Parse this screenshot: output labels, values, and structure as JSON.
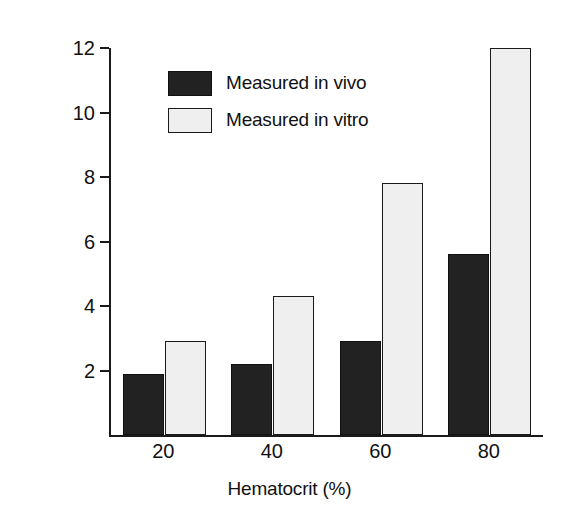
{
  "chart_data": {
    "type": "bar",
    "title": "",
    "xlabel": "Hematocrit (%)",
    "ylabel": "Viscosity (relative to water)",
    "categories": [
      "20",
      "40",
      "60",
      "80"
    ],
    "series": [
      {
        "name": "Measured in vivo",
        "values": [
          1.9,
          2.2,
          2.9,
          5.6
        ],
        "color": "#222222"
      },
      {
        "name": "Measured in vitro",
        "values": [
          2.9,
          4.3,
          7.8,
          12.0
        ],
        "color": "#efefef"
      }
    ],
    "ylim": [
      0,
      12
    ],
    "yticks": [
      "2",
      "4",
      "6",
      "8",
      "10",
      "12"
    ],
    "ytick_values": [
      2,
      4,
      6,
      8,
      10,
      12
    ],
    "grid": false,
    "legend_position": "upper-left-inside"
  },
  "legend": {
    "items": [
      {
        "label": "Measured in vivo",
        "swatch": "dark"
      },
      {
        "label": "Measured in vitro",
        "swatch": "light"
      }
    ]
  }
}
